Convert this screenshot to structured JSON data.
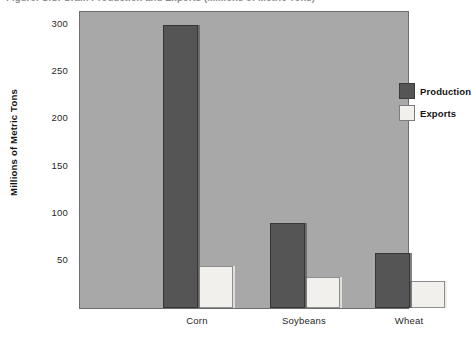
{
  "figure": {
    "title_fragment": "Figure: U.S. Grain Production and Exports (Millions of Metric Tons)"
  },
  "chart_data": {
    "type": "bar",
    "title": "",
    "xlabel": "",
    "ylabel": "Millions of Metric Tons",
    "categories": [
      "Corn",
      "Soybeans",
      "Wheat"
    ],
    "series": [
      {
        "name": "Production",
        "color": "#555555",
        "values": [
          300,
          90,
          58
        ]
      },
      {
        "name": "Exports",
        "color": "#f2f0ec",
        "values": [
          45,
          33,
          29
        ]
      }
    ],
    "ylim": [
      0,
      315
    ],
    "yticks": [
      50,
      100,
      150,
      200,
      250,
      300
    ],
    "ytick_labels": [
      "50",
      "100",
      "150",
      "200",
      "250",
      "300"
    ],
    "grid": false,
    "legend_position": "upper right",
    "plot_background": "#a8a8a8"
  }
}
